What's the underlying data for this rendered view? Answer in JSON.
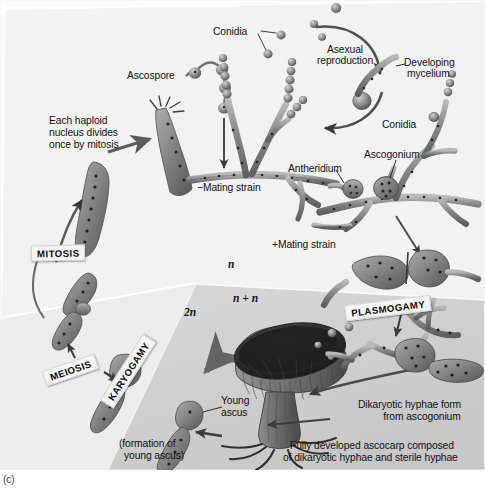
{
  "figure": {
    "caption": "(c)",
    "panel_bg_top": "#f2f2f2",
    "panel_bg_mid": "#eaeaea",
    "panel_bg_dark": "#cfcfcf",
    "ink": "#111111",
    "hypha_fill": "#8d8d8d",
    "hypha_dark": "#4a4a4a",
    "ascocarp_fill": "#6f6f6f",
    "ascocarp_dark": "#2b2b2b"
  },
  "labels": {
    "conidia_top": "Conidia",
    "conidia_right": "Conidia",
    "ascospore": "Ascospore",
    "asexual_reproduction_1": "Asexual",
    "asexual_reproduction_2": "reproduction",
    "developing_mycelium_1": "Developing",
    "developing_mycelium_2": "mycelium",
    "mitosis_note_1": "Each haploid",
    "mitosis_note_2": "nucleus divides",
    "mitosis_note_3": "once by mitosis",
    "minus_mating_strain": "−Mating strain",
    "plus_mating_strain": "+Mating strain",
    "antheridium": "Antheridium",
    "ascogonium": "Ascogonium",
    "young_ascus_1": "Young",
    "young_ascus_2": "ascus",
    "formation_1": "(formation of",
    "formation_2": "young ascus)",
    "dikaryotic_1": "Dikaryotic hyphae form",
    "dikaryotic_2": "from ascogonium",
    "ascocarp_1": "Fully developed ascocarp composed",
    "ascocarp_2": "of dikaryotic hyphae and sterile hyphae"
  },
  "stages": [
    {
      "id": "mitosis",
      "label": "MITOSIS"
    },
    {
      "id": "meiosis",
      "label": "MEIOSIS"
    },
    {
      "id": "karyogamy",
      "label": "KARYOGAMY"
    },
    {
      "id": "plasmogamy",
      "label": "PLASMOGAMY"
    }
  ],
  "ploidy": [
    {
      "id": "n",
      "label": "n"
    },
    {
      "id": "n_n",
      "label": "n + n"
    },
    {
      "id": "two_n",
      "label": "2n"
    }
  ],
  "structures": {
    "ascus_mature": "mature-ascus",
    "ascospore_chain": "ascospore-chain",
    "minus_mycelium": "minus-strain-mycelium",
    "plus_mycelium": "plus-strain-mycelium",
    "conidiophore": "conidiophore",
    "germinating_spore": "germinating-spore",
    "antheridium_body": "antheridium",
    "ascogonium_body": "ascogonium",
    "dikaryotic_hyphae": "dikaryotic-hyphae",
    "ascocarp": "ascocarp-cup",
    "young_ascus_body": "young-ascus",
    "karyogamy_cell": "karyogamy-cell",
    "meiosis_cell": "meiosis-cell",
    "mitosis_cell": "mitosis-cell",
    "haploid_nucleus_cell": "haploid-nucleus-cell"
  }
}
